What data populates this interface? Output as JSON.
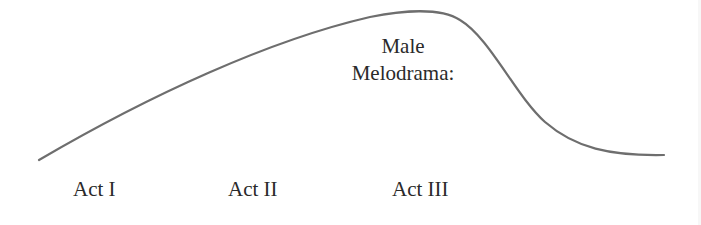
{
  "diagram": {
    "title": "Male Melodrama:",
    "annotation_lines": [
      "Male",
      "Melodrama:"
    ],
    "acts": [
      {
        "label": "Act I"
      },
      {
        "label": "Act II"
      },
      {
        "label": "Act III"
      }
    ],
    "curve": {
      "description": "Rises gradually through Act I and Act II, peaks in Act III, then drops steeply and levels off",
      "color": "#6e6e6e",
      "points": [
        [
          39,
          160
        ],
        [
          150,
          105
        ],
        [
          270,
          52
        ],
        [
          370,
          17
        ],
        [
          415,
          11
        ],
        [
          450,
          14
        ],
        [
          490,
          40
        ],
        [
          540,
          110
        ],
        [
          580,
          140
        ],
        [
          620,
          153
        ],
        [
          664,
          155
        ]
      ]
    }
  }
}
